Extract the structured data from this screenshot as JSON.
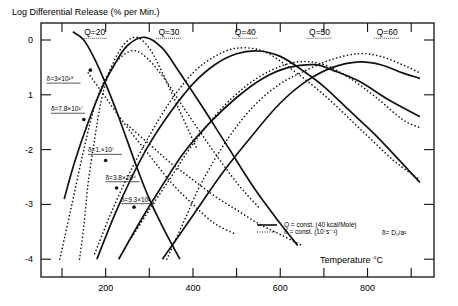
{
  "chart_data": {
    "type": "line",
    "title": "Log Differential Release (% per Min.)",
    "xlabel": "Temperature °C",
    "ylabel": "Log Differential Release (% per Min.)",
    "xlim": [
      50,
      950
    ],
    "ylim": [
      -4.3,
      0.3
    ],
    "xticks": [
      100,
      200,
      300,
      400,
      500,
      600,
      700,
      800,
      900
    ],
    "xtick_labels": [
      "200",
      "400",
      "600",
      "800"
    ],
    "xtick_label_values": [
      200,
      400,
      600,
      800
    ],
    "yticks": [
      0,
      -1,
      -2,
      -3,
      -4
    ],
    "ytick_labels": [
      "0",
      "1",
      "-2",
      "-3",
      "-4"
    ],
    "grid": false,
    "legend": {
      "position": "lower right",
      "entries": [
        {
          "style": "solid",
          "label": "Q = const. (40 kcal/Mole)"
        },
        {
          "style": "dotted",
          "label": "δ = const. (10⁷s⁻¹)"
        }
      ],
      "note": "δ= D₀/a²"
    },
    "q_labels": [
      {
        "text": "Q=20",
        "x": 175,
        "y": 0.05
      },
      {
        "text": "Q=30",
        "x": 345,
        "y": 0.05
      },
      {
        "text": "Q=40",
        "x": 520,
        "y": 0.05
      },
      {
        "text": "Q=50",
        "x": 690,
        "y": 0.05
      },
      {
        "text": "Q=60",
        "x": 845,
        "y": 0.05
      }
    ],
    "delta_labels": [
      {
        "text": "δ=3×10¹⁸",
        "x": 115,
        "y": -0.75,
        "px": 165,
        "py": -0.55
      },
      {
        "text": "δ=7.8×10¹⁷",
        "x": 125,
        "y": -1.3,
        "px": 150,
        "py": -1.45
      },
      {
        "text": "δ=1.×10⁷",
        "x": 210,
        "y": -2.05,
        "px": 200,
        "py": -2.2
      },
      {
        "text": "δ=3.8×10⁴",
        "x": 250,
        "y": -2.55,
        "px": 225,
        "py": -2.7
      },
      {
        "text": "δ=9.3×10²",
        "x": 285,
        "y": -2.95,
        "px": 265,
        "py": -3.05
      }
    ],
    "series": [
      {
        "name": "Q=20 (solid)",
        "style": "solid",
        "x": [
          125,
          150,
          175,
          200,
          225,
          250,
          275,
          300,
          330,
          370
        ],
        "y": [
          0.15,
          0.0,
          -0.35,
          -0.8,
          -1.3,
          -1.85,
          -2.4,
          -2.9,
          -3.4,
          -4.0
        ]
      },
      {
        "name": "Q=30 (solid)",
        "style": "solid",
        "x": [
          105,
          130,
          160,
          190,
          220,
          250,
          290,
          330,
          370,
          420,
          480,
          540,
          600,
          640
        ],
        "y": [
          -2.9,
          -2.2,
          -1.5,
          -0.9,
          -0.45,
          -0.1,
          0.05,
          -0.15,
          -0.6,
          -1.2,
          -1.95,
          -2.7,
          -3.35,
          -3.75
        ]
      },
      {
        "name": "Q=40 (solid)",
        "style": "solid",
        "x": [
          180,
          220,
          260,
          300,
          350,
          400,
          450,
          500,
          550,
          600,
          650,
          700,
          760,
          820,
          920
        ],
        "y": [
          -4.0,
          -3.2,
          -2.5,
          -1.9,
          -1.3,
          -0.8,
          -0.45,
          -0.25,
          -0.2,
          -0.3,
          -0.55,
          -0.85,
          -1.3,
          -1.75,
          -2.6
        ]
      },
      {
        "name": "Q=50 (solid)",
        "style": "solid",
        "x": [
          230,
          280,
          330,
          380,
          440,
          500,
          560,
          620,
          680,
          720,
          780,
          850,
          920
        ],
        "y": [
          -4.0,
          -3.3,
          -2.65,
          -2.05,
          -1.5,
          -1.05,
          -0.7,
          -0.5,
          -0.45,
          -0.55,
          -0.75,
          -1.1,
          -1.4
        ]
      },
      {
        "name": "Q=60 (solid)",
        "style": "solid",
        "x": [
          330,
          400,
          470,
          540,
          600,
          660,
          720,
          780,
          830,
          880,
          920
        ],
        "y": [
          -4.0,
          -3.2,
          -2.4,
          -1.7,
          -1.15,
          -0.75,
          -0.5,
          -0.4,
          -0.45,
          -0.6,
          -0.7
        ]
      },
      {
        "name": "δ=3×10¹⁸ (dotted)",
        "style": "dotted",
        "x": [
          140,
          150,
          160,
          175,
          190,
          210,
          240,
          270,
          300,
          330,
          370,
          410
        ],
        "y": [
          -4.0,
          -3.4,
          -2.6,
          -1.8,
          -1.1,
          -0.55,
          -0.1,
          0.05,
          -0.15,
          -0.6,
          -1.3,
          -2.0
        ]
      },
      {
        "name": "δ=7.8×10¹⁷ (dotted)",
        "style": "dotted",
        "x": [
          95,
          120,
          150,
          175,
          200,
          230,
          270,
          320,
          380,
          440,
          500,
          550
        ],
        "y": [
          -4.0,
          -3.1,
          -2.0,
          -1.2,
          -0.7,
          -0.35,
          -0.2,
          -0.55,
          -1.25,
          -1.95,
          -2.6,
          -3.05
        ]
      },
      {
        "name": "δ=1.×10⁷ (dotted)",
        "style": "dotted",
        "x": [
          175,
          210,
          250,
          300,
          350,
          400,
          450,
          500,
          560,
          620,
          700,
          780,
          860,
          920
        ],
        "y": [
          -3.9,
          -3.2,
          -2.5,
          -1.75,
          -1.1,
          -0.6,
          -0.3,
          -0.15,
          -0.2,
          -0.5,
          -1.0,
          -1.6,
          -2.2,
          -2.55
        ]
      },
      {
        "name": "δ=3.8×10⁴ (dotted)",
        "style": "dotted",
        "x": [
          260,
          300,
          350,
          400,
          460,
          520,
          580,
          640,
          700,
          760,
          820,
          880,
          920
        ],
        "y": [
          -3.6,
          -3.1,
          -2.5,
          -1.9,
          -1.3,
          -0.85,
          -0.55,
          -0.4,
          -0.45,
          -0.7,
          -1.05,
          -1.45,
          -1.6
        ]
      },
      {
        "name": "δ=9.3×10² (dotted)",
        "style": "dotted",
        "x": [
          340,
          380,
          420,
          480,
          540,
          600,
          660,
          720,
          780,
          830,
          880,
          920
        ],
        "y": [
          -4.0,
          -3.3,
          -2.6,
          -1.8,
          -1.2,
          -0.8,
          -0.55,
          -0.35,
          -0.25,
          -0.3,
          -0.45,
          -0.6
        ]
      },
      {
        "name": "descending tail (dotted)",
        "style": "dotted",
        "x": [
          160,
          200,
          250,
          300,
          350,
          400,
          450,
          500
        ],
        "y": [
          -0.6,
          -1.05,
          -1.6,
          -2.1,
          -2.6,
          -3.0,
          -3.35,
          -3.55
        ]
      },
      {
        "name": "descending tail 2 (dotted)",
        "style": "dotted",
        "x": [
          250,
          300,
          350,
          400,
          450,
          500,
          550,
          600,
          650
        ],
        "y": [
          -1.55,
          -1.9,
          -2.25,
          -2.55,
          -2.85,
          -3.1,
          -3.35,
          -3.55,
          -3.75
        ]
      }
    ]
  }
}
